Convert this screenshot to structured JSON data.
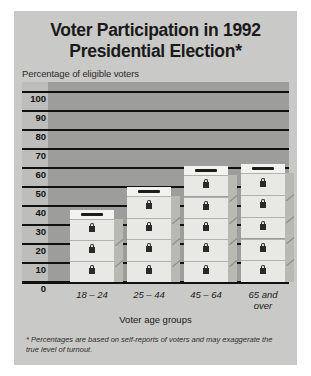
{
  "poster": {
    "title_lines": [
      "Voter Participation in 1992",
      "Presidential Election*"
    ],
    "subtitle": "Percentage of eligible voters",
    "xaxis_title": "Voter age groups",
    "footnote": "* Percentages are based on self-reports of voters and may exaggerate the true level of turnout.",
    "colors": {
      "poster_background": "#c9c9c7",
      "plot_background": "#9d9d9b",
      "ylabel_channel": "#bdbdbb",
      "gridline": "#111111",
      "box_front": "#e8e8e4",
      "box_top": "#f2f2ee",
      "box_side": "#b9b9b3",
      "text": "#1a1a1a"
    }
  },
  "chart_data": {
    "type": "bar",
    "title": "Voter Participation in 1992 Presidential Election*",
    "xlabel": "Voter age groups",
    "ylabel": "Percentage of eligible voters",
    "categories": [
      "18 – 24",
      "25 – 44",
      "45 – 64",
      "65 and over"
    ],
    "category_lines": [
      [
        "18 – 24"
      ],
      [
        "25 – 44"
      ],
      [
        "45 – 64"
      ],
      [
        "65 and",
        "over"
      ]
    ],
    "values": [
      38,
      50,
      61,
      62
    ],
    "box_counts": [
      3,
      4,
      5,
      5
    ],
    "ylim": [
      0,
      100
    ],
    "yticks": [
      100,
      90,
      80,
      70,
      60,
      50,
      40,
      30,
      20,
      10,
      0
    ],
    "grid": true,
    "legend": "none",
    "annotations": [
      "* Percentages are based on self-reports of voters and may exaggerate the true level of turnout."
    ]
  }
}
